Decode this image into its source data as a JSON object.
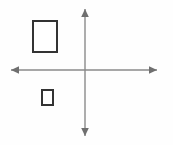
{
  "figure": {
    "background_color": "#fefefe",
    "width": 173,
    "height": 145
  },
  "axes": {
    "origin": {
      "x": 85,
      "y": 70
    },
    "line_color": "#8a8a8a",
    "line_width": 1.4,
    "arrowhead_color": "#6f6f6f",
    "horizontal": {
      "name": "x-axis",
      "x_start": 11,
      "x_end": 157,
      "y": 70,
      "arrow_left": true,
      "arrow_right": true,
      "label": ""
    },
    "vertical": {
      "name": "y-axis",
      "y_start": 9,
      "y_end": 136,
      "x": 85,
      "arrow_up": true,
      "arrow_down": true,
      "label": ""
    }
  },
  "shapes": [
    {
      "name": "large-rectangle",
      "type": "rectangle",
      "quadrant": "upper-left",
      "x": 32,
      "y": 20,
      "width": 26,
      "height": 33,
      "stroke": "#333333",
      "stroke_width": 2,
      "fill": "#ffffff",
      "label": ""
    },
    {
      "name": "small-rectangle",
      "type": "rectangle",
      "quadrant": "lower-left",
      "x": 41,
      "y": 89,
      "width": 13,
      "height": 17,
      "stroke": "#333333",
      "stroke_width": 2,
      "fill": "#ffffff",
      "label": ""
    }
  ],
  "colors": {
    "stroke_dark": "#333333",
    "axis_gray": "#8a8a8a",
    "fill_white": "#ffffff",
    "background": "#fefefe"
  }
}
